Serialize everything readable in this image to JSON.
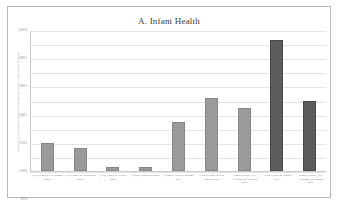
{
  "figure": {
    "title": "A. Infant Health"
  },
  "chart_data": {
    "type": "bar",
    "title": "A. Infant Health",
    "xlabel": "",
    "ylabel": "Percent of studies finding statistically significant effects / associations (percent)",
    "ylim": [
      0,
      200
    ],
    "ytick_values": [
      0,
      20,
      40,
      60,
      80,
      100,
      120,
      140,
      160,
      180,
      200
    ],
    "ytick_labels": [
      "0%",
      "20%",
      "40%",
      "60%",
      "80%",
      "100%",
      "120%",
      "140%",
      "160%",
      "180%",
      "200%"
    ],
    "grid": true,
    "legend": "none",
    "unit": "%",
    "colors": {
      "bar_light": "#9a9a9a",
      "bar_dark": "#5c5c5c",
      "gridline": "#e4e4e4",
      "axis": "#c9c9c9",
      "border": "#b9b9b9",
      "text": "#6d6d6d",
      "title_text": "#3a3a3a"
    },
    "categories": [
      "(TSP) Chay & Greenstone 2003a",
      "(TSP) Chay & Greenstone 2003b",
      "(CO) Currie & Neidell 2005",
      "(NO2) Lauderdale 2001",
      "(PM2.5, PM10) Parkerm 2011",
      "(PM10) Kim, Woo & Basilio 2016",
      "(PM2.5, PM10, O3) Alexander & Schwab 2018",
      "(NO2) Currie & Walker 2011",
      "(PM2.5, PM10, O3) Alexander & Schwab 2019"
    ],
    "values": [
      40,
      32,
      6,
      6,
      70,
      104,
      90,
      186,
      100
    ],
    "bar_shades": [
      "light",
      "light",
      "light",
      "light",
      "light",
      "light",
      "light",
      "dark",
      "dark"
    ]
  }
}
